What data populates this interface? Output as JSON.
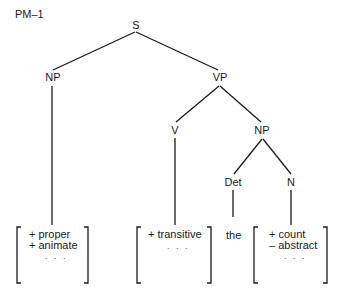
{
  "title": "PM–1",
  "tree": {
    "root": "S",
    "np_subject": "NP",
    "vp": "VP",
    "verb": "V",
    "np_object": "NP",
    "det": "Det",
    "noun": "N"
  },
  "leaves": {
    "subject_features": [
      "+ proper",
      "+ animate"
    ],
    "subject_ellipsis": ". . .",
    "verb_features": [
      "+ transitive"
    ],
    "verb_ellipsis": ". . .",
    "determiner_word": "the",
    "noun_features": [
      "+ count",
      "– abstract"
    ],
    "noun_ellipsis": ". . ."
  }
}
